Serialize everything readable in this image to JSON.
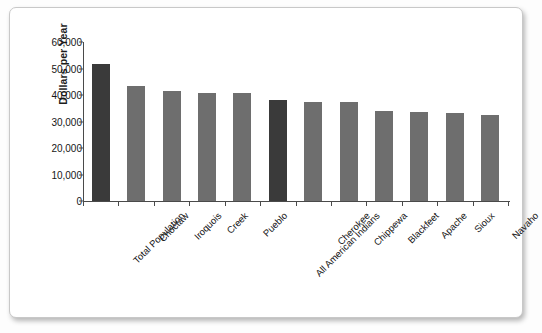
{
  "chart_data": {
    "type": "bar",
    "title": "",
    "xlabel": "",
    "ylabel": "Dollars per Year",
    "ylim": [
      0,
      60000
    ],
    "ytick_labels": [
      "0",
      "10,000",
      "20,000",
      "30,000",
      "40,000",
      "50,000",
      "60,000"
    ],
    "ytick_values": [
      0,
      10000,
      20000,
      30000,
      40000,
      50000,
      60000
    ],
    "grid": false,
    "legend": "none",
    "categories": [
      "Total Population",
      "Choctaw",
      "Iroquois",
      "Creek",
      "Pueblo",
      "All American Indians",
      "Cherokee",
      "Chippewa",
      "Blackfeet",
      "Apache",
      "Sioux",
      "Navaho"
    ],
    "values": [
      51800,
      43500,
      41600,
      40900,
      40700,
      38000,
      37500,
      37400,
      33800,
      33600,
      33200,
      32400
    ],
    "highlighted": [
      true,
      false,
      false,
      false,
      false,
      true,
      false,
      false,
      false,
      false,
      false,
      false
    ],
    "colors": {
      "bar": "#6e6e6e",
      "bar_highlight": "#3a3a3a",
      "axis": "#4a4a4a",
      "text": "#131313",
      "background": "#ffffff"
    }
  }
}
